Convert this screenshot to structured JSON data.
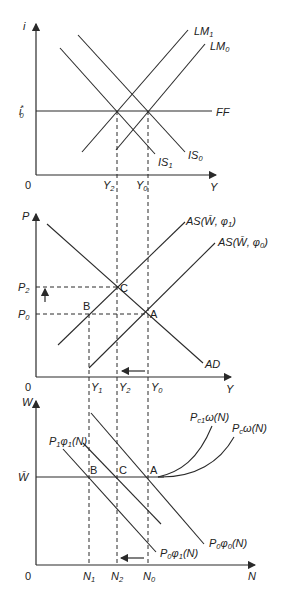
{
  "figure": {
    "panels": [
      {
        "id": "is-lm",
        "y_axis": "i",
        "x_axis": "Y",
        "origin": "0",
        "y_tick": "i0*",
        "x_ticks": [
          "Y2",
          "Y0"
        ],
        "curves": [
          "LM1",
          "LM0",
          "IS0",
          "IS1",
          "FF"
        ]
      },
      {
        "id": "as-ad",
        "y_axis": "P",
        "x_axis": "Y",
        "origin": "0",
        "y_ticks": [
          "P2",
          "P0"
        ],
        "x_ticks": [
          "Y1",
          "Y2",
          "Y0"
        ],
        "curves": [
          "AS(W̄, φ1)",
          "AS(W̄, φ0)",
          "AD"
        ],
        "points": [
          "A",
          "B",
          "C"
        ]
      },
      {
        "id": "labor-market",
        "y_axis": "W",
        "x_axis": "N",
        "origin": "0",
        "y_tick": "W̄",
        "x_ticks": [
          "N1",
          "N2",
          "N0"
        ],
        "curves": [
          "P1φ1(N)",
          "P0φ1(N)",
          "P0φ0(N)",
          "Pc1ω(N)",
          "Pcω(N)"
        ],
        "points": [
          "B",
          "C",
          "A"
        ]
      }
    ]
  },
  "labels": {
    "p1": {
      "i": "i",
      "Y": "Y",
      "zero": "0",
      "i0": "i",
      "i0sub": "0",
      "i0sup": "*",
      "Y2": "Y",
      "Y2sub": "2",
      "Y0": "Y",
      "Y0sub": "0",
      "LM1": "LM",
      "LM1sub": "1",
      "LM0": "LM",
      "LM0sub": "0",
      "IS0": "IS",
      "IS0sub": "0",
      "IS1": "IS",
      "IS1sub": "1",
      "FF": "FF"
    },
    "p2": {
      "P": "P",
      "Y": "Y",
      "zero": "0",
      "P2": "P",
      "P2sub": "2",
      "P0": "P",
      "P0sub": "0",
      "Y1": "Y",
      "Y1sub": "1",
      "Y2": "Y",
      "Y2sub": "2",
      "Y0": "Y",
      "Y0sub": "0",
      "AS1": "AS(W̄, φ",
      "AS1sub": "1",
      "AS1end": ")",
      "AS0": "AS(W̄, φ",
      "AS0sub": "0",
      "AS0end": ")",
      "AD": "AD",
      "A": "A",
      "B": "B",
      "C": "C"
    },
    "p3": {
      "W": "W",
      "N": "N",
      "zero": "0",
      "Wbar": "W̄",
      "N1": "N",
      "N1sub": "1",
      "N2": "N",
      "N2sub": "2",
      "N0": "N",
      "N0sub": "0",
      "P1phi1": "P",
      "P1phi1sub": "1",
      "P1phi1mid": "φ",
      "P1phi1sub2": "1",
      "P1phi1end": "(N)",
      "P0phi1": "P",
      "P0phi1sub": "0",
      "P0phi1mid": "φ",
      "P0phi1sub2": "1",
      "P0phi1end": "(N)",
      "P0phi0": "P",
      "P0phi0sub": "0",
      "P0phi0mid": "φ",
      "P0phi0sub2": "0",
      "P0phi0end": "(N)",
      "Pc1": "P",
      "Pc1sub": "c1",
      "Pc1end": "ω(N)",
      "Pc": "P",
      "Pcsub": "c",
      "Pcend": "ω(N)",
      "A": "A",
      "B": "B",
      "C": "C"
    }
  },
  "colors": {
    "ink": "#2a2a2a",
    "background": "#ffffff"
  }
}
